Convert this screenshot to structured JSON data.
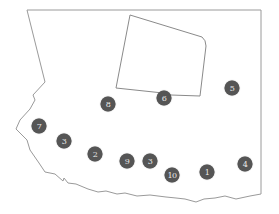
{
  "map": {
    "outline_color": "#9a9a9a",
    "marker_color": "#555555",
    "marker_text_color": "#e8e8e8",
    "markers": [
      {
        "label": "7",
        "x": 39,
        "y": 126
      },
      {
        "label": "3",
        "x": 64,
        "y": 141
      },
      {
        "label": "2",
        "x": 95,
        "y": 154
      },
      {
        "label": "9",
        "x": 127,
        "y": 161
      },
      {
        "label": "3",
        "x": 150,
        "y": 161
      },
      {
        "label": "10",
        "x": 172,
        "y": 175
      },
      {
        "label": "1",
        "x": 207,
        "y": 172
      },
      {
        "label": "4",
        "x": 245,
        "y": 164
      },
      {
        "label": "8",
        "x": 108,
        "y": 104
      },
      {
        "label": "6",
        "x": 164,
        "y": 98
      },
      {
        "label": "5",
        "x": 232,
        "y": 88
      }
    ]
  }
}
